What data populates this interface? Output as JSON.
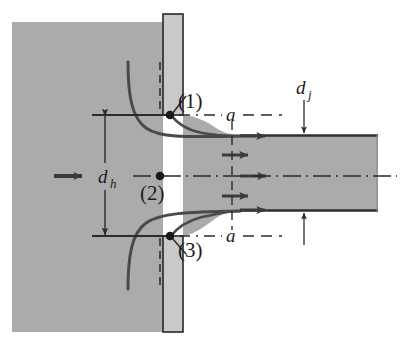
{
  "figure": {
    "name": "orifice-jet-vena-contracta-diagram",
    "type": "engineering-diagram",
    "width": 400,
    "height": 346,
    "background_color": "#ffffff"
  },
  "colors": {
    "fluid_gray": "#ababab",
    "plate_gray": "#c9c9c9",
    "line_dark": "#2b2b2b",
    "streamline": "#4a4a4a",
    "white": "#ffffff"
  },
  "labels": {
    "point_1": "(1)",
    "point_2": "(2)",
    "point_3": "(3)",
    "hole_diameter": "d",
    "hole_diameter_sub": "h",
    "jet_diameter": "d",
    "jet_diameter_sub": "j",
    "section_a_top": "a",
    "section_a_bottom": "a"
  },
  "elements": {
    "reservoir": "fluid-reservoir-region",
    "plate_upper": "orifice-plate-upper",
    "plate_lower": "orifice-plate-lower",
    "jet": "exit-jet-region",
    "inflow_arrow": "inflow-velocity-arrow",
    "velocity_arrows_count": 5,
    "streamlines_count": 4,
    "centerline": "axis-centerline",
    "section_line": "section-a-a-line",
    "dimension_dh": "hole-diameter-dimension",
    "dimension_dj": "jet-diameter-dimension"
  },
  "geometry": {
    "plate_x_left": 163,
    "plate_x_right": 183,
    "plate_top_y": 14,
    "plate_bottom_y": 332,
    "orifice_top_y": 115,
    "orifice_bottom_y": 236,
    "centerline_y": 176,
    "jet_top_y": 135,
    "jet_bottom_y": 211,
    "jet_right_x": 378,
    "reservoir_top_y": 22,
    "reservoir_bottom_y": 332,
    "section_line_x": 232
  }
}
